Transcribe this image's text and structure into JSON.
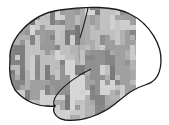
{
  "figure": {
    "view": "lateral brain surface",
    "background": "#ffffff",
    "outline_color": "#1a1a1a",
    "texture": {
      "cell_size": 5,
      "clip_right": 136,
      "gray_min": 120,
      "gray_max": 215,
      "seed": 7
    }
  }
}
